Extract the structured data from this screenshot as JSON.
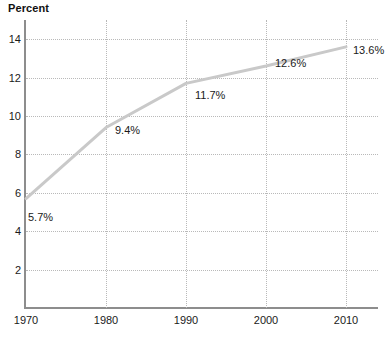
{
  "chart_data": {
    "type": "line",
    "title": "",
    "ylabel": "Percent",
    "xlabel": "",
    "x": [
      1970,
      1980,
      1990,
      2000,
      2010
    ],
    "values": [
      5.7,
      9.4,
      11.7,
      12.6,
      13.6
    ],
    "point_labels": [
      "5.7%",
      "9.4%",
      "11.7%",
      "12.6%",
      "13.6%"
    ],
    "xtick_labels": [
      "1970",
      "1980",
      "1990",
      "2000",
      "2010"
    ],
    "ytick_labels": [
      "2",
      "4",
      "6",
      "8",
      "10",
      "12",
      "14"
    ],
    "ytick_values": [
      2,
      4,
      6,
      8,
      10,
      12,
      14
    ],
    "ylim": [
      0,
      15
    ],
    "xlim": [
      1970,
      2014
    ],
    "grid": true,
    "legend": "none",
    "series_color": "#c9c9c9",
    "axis_color": "#8d8d8d",
    "grid_color": "#b9b9b9",
    "text_color": "#1a1a1a",
    "background": "#ffffff"
  }
}
